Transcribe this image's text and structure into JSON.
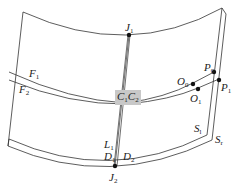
{
  "diagram": {
    "type": "geometric-surface-diagram",
    "colors": {
      "line": "#333333",
      "point": "#111111",
      "highlight_bg": "#c8c8c8",
      "background": "#ffffff"
    },
    "labels": {
      "J1": {
        "base": "J",
        "sub": "1"
      },
      "J2": {
        "base": "J",
        "sub": "2"
      },
      "F1": {
        "base": "F",
        "sub": "1"
      },
      "F2": {
        "base": "F",
        "sub": "2"
      },
      "C1C2": {
        "base1": "C",
        "sub1": "1",
        "base2": "C",
        "sub2": "2"
      },
      "O0": {
        "base": "O",
        "sub": "0"
      },
      "O1": {
        "base": "O",
        "sub": "1"
      },
      "P0": {
        "base": "P",
        "sub": "0"
      },
      "P1": {
        "base": "P",
        "sub": "1"
      },
      "Sl": {
        "base": "S",
        "sub": "l"
      },
      "Sr": {
        "base": "S",
        "sub": "r"
      },
      "L1": {
        "base": "L",
        "sub": "1"
      },
      "D1": {
        "base": "D",
        "sub": "1"
      },
      "D2": {
        "base": "D",
        "sub": "2"
      }
    }
  }
}
